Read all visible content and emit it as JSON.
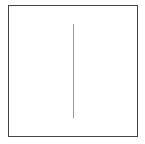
{
  "diagram": {
    "shapes": [
      {
        "type": "rectangle",
        "role": "frame",
        "x": 8,
        "y": 5,
        "width": 130,
        "height": 132,
        "stroke": "#444444"
      },
      {
        "type": "line",
        "role": "vertical-divider",
        "x1": 73,
        "y1": 24,
        "x2": 73,
        "y2": 118,
        "stroke": "#999999"
      }
    ],
    "colors": {
      "background": "#ffffff",
      "frame": "#444444",
      "line": "#999999"
    }
  }
}
